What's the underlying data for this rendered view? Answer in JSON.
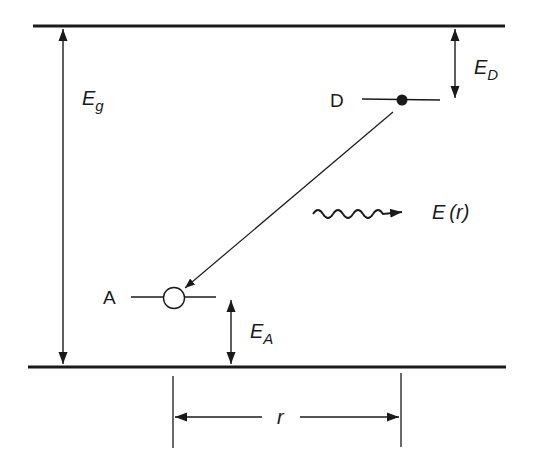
{
  "diagram": {
    "colors": {
      "ink": "#1a1a1a",
      "background": "#ffffff"
    },
    "labels": {
      "band_gap": {
        "main": "E",
        "sub": "g"
      },
      "donor_energy": {
        "main": "E",
        "sub": "D"
      },
      "acceptor_energy": {
        "main": "E",
        "sub": "A"
      },
      "donor": "D",
      "acceptor": "A",
      "emission": {
        "main": "E",
        "arg": "(r)"
      },
      "separation": "r"
    },
    "elements": {
      "conduction_band_edge": {
        "y": 26
      },
      "valence_band_edge": {
        "y": 367
      },
      "donor_level": {
        "y": 100,
        "x1": 362,
        "x2": 440,
        "electron": "filled-dot"
      },
      "acceptor_level": {
        "y": 297,
        "x1": 131,
        "x2": 216,
        "hole": "open-circle"
      },
      "transition": "diagonal arrow from donor to acceptor",
      "photon": "wavy arrow labelled E(r)"
    }
  }
}
